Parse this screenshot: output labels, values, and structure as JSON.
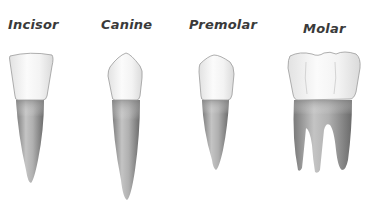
{
  "diagram": {
    "type": "illustration",
    "teeth": [
      {
        "name": "Incisor",
        "label": "Incisor",
        "roots": 1
      },
      {
        "name": "Canine",
        "label": "Canine",
        "roots": 1
      },
      {
        "name": "Premolar",
        "label": "Premolar",
        "roots": 1
      },
      {
        "name": "Molar",
        "label": "Molar",
        "roots": 3
      }
    ],
    "colors": {
      "crown": "#f4f4f4",
      "crown_outline": "#9a9a9a",
      "root": "#a8a8a8",
      "root_dark": "#6e6e6e",
      "label": "#3a3a3a",
      "background": "#ffffff"
    }
  }
}
